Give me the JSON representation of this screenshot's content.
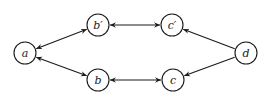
{
  "diagram": {
    "type": "directed-graph",
    "nodes": [
      {
        "id": "a",
        "label": "a"
      },
      {
        "id": "bp",
        "label": "b′"
      },
      {
        "id": "cp",
        "label": "c′"
      },
      {
        "id": "b",
        "label": "b"
      },
      {
        "id": "c",
        "label": "c"
      },
      {
        "id": "d",
        "label": "d"
      }
    ],
    "edges": [
      {
        "from": "a",
        "to": "bp",
        "direction": "both"
      },
      {
        "from": "a",
        "to": "b",
        "direction": "both"
      },
      {
        "from": "bp",
        "to": "cp",
        "direction": "both"
      },
      {
        "from": "b",
        "to": "c",
        "direction": "both"
      },
      {
        "from": "d",
        "to": "cp",
        "direction": "forward"
      },
      {
        "from": "d",
        "to": "c",
        "direction": "forward"
      }
    ]
  }
}
